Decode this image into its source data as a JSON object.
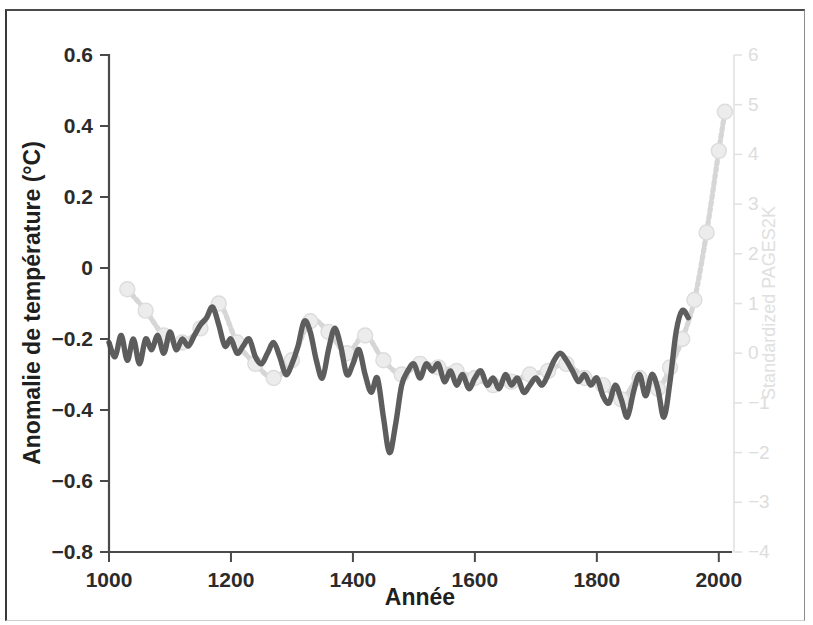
{
  "figure": {
    "frame_color": "#3a3a3a",
    "background": "#ffffff"
  },
  "chart_data": {
    "type": "line",
    "title": "",
    "subtitle": "",
    "xlabel": "Année",
    "ylabel": "Anomalie de température (°C)",
    "ylabel_right": "Standardized PAGES2K",
    "xlim": [
      1000,
      2020
    ],
    "ylim": [
      -0.8,
      0.6
    ],
    "ylim_right": [
      -4,
      6
    ],
    "xticks": [
      1000,
      1200,
      1400,
      1600,
      1800,
      2000
    ],
    "xticklabels": [
      "1000",
      "1200",
      "1400",
      "1600",
      "1800",
      "2000"
    ],
    "yticks": [
      0.6,
      0.4,
      0.2,
      0,
      -0.2,
      -0.4,
      -0.6,
      -0.8
    ],
    "yticklabels": [
      "0.6",
      "0.4",
      "0.2",
      "0",
      "-0.2",
      "-0.4",
      "-0.6",
      "-0.8"
    ],
    "yticks_right": [
      6,
      5,
      4,
      3,
      2,
      1,
      0,
      -1,
      -2,
      -3,
      -4
    ],
    "yticklabels_right": [
      "6",
      "5",
      "4",
      "3",
      "2",
      "1",
      "0",
      "-1",
      "-2",
      "-3",
      "-4"
    ],
    "grid": false,
    "legend": "none",
    "colors": {
      "reconstruction": "#5d5d5d",
      "pages2k": "#d6d6d6",
      "marker": "#ececec",
      "axis": "#4a4a4a",
      "right_axis": "#e2e2e2"
    },
    "series": [
      {
        "name": "Anomalie de température reconstruite",
        "style": "solid",
        "color": "#5d5d5d",
        "x": [
          1000,
          1010,
          1020,
          1030,
          1040,
          1050,
          1060,
          1070,
          1080,
          1090,
          1100,
          1110,
          1120,
          1130,
          1140,
          1150,
          1160,
          1170,
          1180,
          1190,
          1200,
          1210,
          1220,
          1230,
          1240,
          1250,
          1260,
          1270,
          1280,
          1290,
          1300,
          1310,
          1320,
          1330,
          1340,
          1350,
          1360,
          1370,
          1380,
          1390,
          1400,
          1410,
          1420,
          1430,
          1440,
          1450,
          1460,
          1470,
          1480,
          1490,
          1500,
          1510,
          1520,
          1530,
          1540,
          1550,
          1560,
          1570,
          1580,
          1590,
          1600,
          1610,
          1620,
          1630,
          1640,
          1650,
          1660,
          1670,
          1680,
          1690,
          1700,
          1710,
          1720,
          1730,
          1740,
          1750,
          1760,
          1770,
          1780,
          1790,
          1800,
          1810,
          1820,
          1830,
          1840,
          1850,
          1860,
          1870,
          1880,
          1890,
          1900,
          1910,
          1920,
          1930,
          1940,
          1950
        ],
        "y": [
          -0.21,
          -0.25,
          -0.19,
          -0.26,
          -0.2,
          -0.27,
          -0.2,
          -0.23,
          -0.19,
          -0.24,
          -0.18,
          -0.23,
          -0.2,
          -0.22,
          -0.19,
          -0.16,
          -0.14,
          -0.11,
          -0.16,
          -0.22,
          -0.2,
          -0.24,
          -0.22,
          -0.2,
          -0.25,
          -0.27,
          -0.24,
          -0.21,
          -0.25,
          -0.3,
          -0.27,
          -0.22,
          -0.15,
          -0.18,
          -0.26,
          -0.31,
          -0.23,
          -0.17,
          -0.22,
          -0.3,
          -0.27,
          -0.23,
          -0.3,
          -0.35,
          -0.31,
          -0.42,
          -0.52,
          -0.44,
          -0.33,
          -0.29,
          -0.27,
          -0.31,
          -0.27,
          -0.29,
          -0.27,
          -0.32,
          -0.29,
          -0.33,
          -0.3,
          -0.34,
          -0.31,
          -0.29,
          -0.33,
          -0.31,
          -0.34,
          -0.3,
          -0.33,
          -0.31,
          -0.35,
          -0.33,
          -0.31,
          -0.33,
          -0.3,
          -0.26,
          -0.24,
          -0.26,
          -0.29,
          -0.32,
          -0.3,
          -0.33,
          -0.31,
          -0.36,
          -0.38,
          -0.33,
          -0.37,
          -0.42,
          -0.35,
          -0.3,
          -0.36,
          -0.3,
          -0.34,
          -0.42,
          -0.32,
          -0.18,
          -0.12,
          -0.14
        ]
      },
      {
        "name": "Standardized PAGES2K",
        "style": "dotted-marker",
        "color": "#d6d6d6",
        "x": [
          1030,
          1060,
          1090,
          1120,
          1150,
          1180,
          1210,
          1240,
          1270,
          1300,
          1330,
          1360,
          1390,
          1420,
          1450,
          1480,
          1510,
          1540,
          1570,
          1600,
          1630,
          1660,
          1690,
          1720,
          1750,
          1780,
          1810,
          1840,
          1870,
          1900,
          1920,
          1940,
          1960,
          1980,
          2000,
          2010
        ],
        "y": [
          -0.06,
          -0.12,
          -0.19,
          -0.21,
          -0.17,
          -0.1,
          -0.21,
          -0.27,
          -0.31,
          -0.26,
          -0.15,
          -0.18,
          -0.24,
          -0.19,
          -0.26,
          -0.3,
          -0.27,
          -0.28,
          -0.29,
          -0.31,
          -0.33,
          -0.32,
          -0.3,
          -0.29,
          -0.27,
          -0.31,
          -0.33,
          -0.37,
          -0.31,
          -0.34,
          -0.28,
          -0.2,
          -0.09,
          0.1,
          0.33,
          0.44
        ],
        "markers": true
      }
    ]
  },
  "axes": {
    "left_title": "Anomalie de température (°C)",
    "bottom_title": "Année",
    "right_title": "Standardized PAGES2K"
  }
}
